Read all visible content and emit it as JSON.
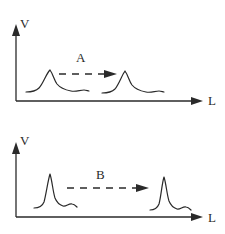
{
  "diagram": {
    "panels": [
      {
        "id": "A",
        "y_axis_label": "V",
        "x_axis_label": "L",
        "transition_label": "A",
        "pulse_shape": "broad peak with tail",
        "description": "Pulse propagates along L with broadened shape"
      },
      {
        "id": "B",
        "y_axis_label": "V",
        "x_axis_label": "L",
        "transition_label": "B",
        "pulse_shape": "narrow sharp peak",
        "description": "Narrow pulse propagates along L preserving shape"
      }
    ],
    "colors": {
      "ink": "#2a2a2a",
      "background": "#ffffff"
    }
  }
}
